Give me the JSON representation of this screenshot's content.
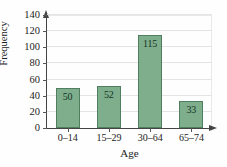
{
  "chart_data": {
    "type": "bar",
    "title": "",
    "subtitle": "",
    "categories": [
      "0–14",
      "15–29",
      "30–64",
      "65–74"
    ],
    "values": [
      50,
      52,
      115,
      33
    ],
    "data_labels": [
      "50",
      "52",
      "115",
      "33"
    ],
    "xlabel": "Age",
    "ylabel": "Frequency",
    "ylim": [
      0,
      140
    ],
    "ytick_step": 20,
    "yticks": [
      0,
      20,
      40,
      60,
      80,
      100,
      120,
      140
    ],
    "ytick_labels": [
      "0",
      "20",
      "40",
      "60",
      "80",
      "100",
      "120",
      "140"
    ],
    "grid": true,
    "grid_axis": "y",
    "legend": false,
    "legend_position": "none",
    "bar_fill_color": "#7fae8d",
    "bar_edge_color": "#4f7f5e",
    "grid_color": "#e4e4e4",
    "axis_color": "#444444",
    "text_color": "#1b1b1b",
    "background_color": "#fefefe",
    "axis_arrows": true
  }
}
